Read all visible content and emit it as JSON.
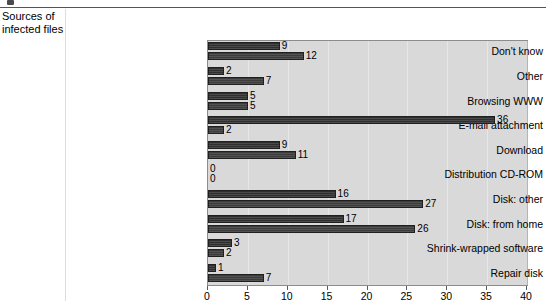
{
  "header": {
    "marker_icon": "square-marker-icon",
    "caption": "Sources of\ninfected files"
  },
  "chart_data": {
    "type": "bar",
    "orientation": "horizontal",
    "title": "",
    "subtitle": "",
    "xlabel": "",
    "ylabel": "",
    "xlim": [
      0,
      40
    ],
    "xticks": [
      0,
      5,
      10,
      15,
      20,
      25,
      30,
      35,
      40
    ],
    "xtick_labels": [
      "0",
      "5",
      "10",
      "15",
      "20",
      "25",
      "30",
      "35",
      "40"
    ],
    "grid": false,
    "legend": "none",
    "categories": [
      "Don't know",
      "Other",
      "Browsing WWW",
      "E-mail attachment",
      "Download",
      "Distribution CD-ROM",
      "Disk: other",
      "Disk: from home",
      "Shrink-wrapped software",
      "Repair disk"
    ],
    "series": [
      {
        "name": "series-1",
        "values": [
          9,
          2,
          5,
          36,
          9,
          0,
          16,
          17,
          3,
          1
        ]
      },
      {
        "name": "series-2",
        "values": [
          12,
          7,
          5,
          2,
          11,
          0,
          27,
          26,
          2,
          7
        ]
      }
    ],
    "colors": {
      "plot_background": "#d9d9d9",
      "plot_border": "#8c8c8c",
      "bar_series_1": "#2f2f2f",
      "bar_series_2": "#3c3c3c",
      "text": "#000000"
    }
  }
}
